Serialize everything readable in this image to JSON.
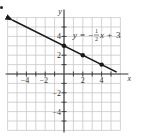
{
  "chart_data": {
    "type": "line",
    "title": "",
    "equation_label": "y = -½x + 3",
    "equation_parts": {
      "lhs": "y",
      "eq": "=",
      "neg": "−",
      "num": "1",
      "den": "2",
      "var": "x",
      "plus": "+",
      "const": "3"
    },
    "xlabel": "x",
    "ylabel": "y",
    "xlim": [
      -6,
      6
    ],
    "ylim": [
      -6,
      6
    ],
    "grid": true,
    "x_ticks": [
      -4,
      -2,
      2,
      4
    ],
    "y_ticks": [
      4,
      2,
      -2,
      -4
    ],
    "x_tick_labels": [
      "−4",
      "−2",
      "2",
      "4"
    ],
    "y_tick_labels": [
      "4",
      "2",
      "−2",
      "−4"
    ],
    "line": {
      "slope": -0.5,
      "intercept": 3,
      "x_start": -5.5,
      "x_end": 5.6,
      "arrow_left": true
    },
    "points": [
      {
        "x": 0,
        "y": 3
      },
      {
        "x": 2,
        "y": 2
      },
      {
        "x": 4,
        "y": 1
      }
    ],
    "colors": {
      "grid": "#c8c8c8",
      "axis": "#333333",
      "line": "#1a1a1a",
      "text": "#333333"
    }
  }
}
